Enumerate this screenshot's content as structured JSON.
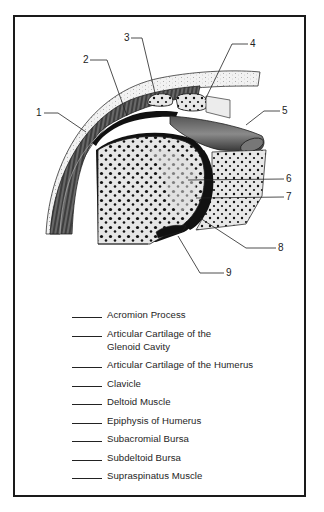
{
  "figure": {
    "callouts": [
      {
        "number": "1"
      },
      {
        "number": "2"
      },
      {
        "number": "3"
      },
      {
        "number": "4"
      },
      {
        "number": "5"
      },
      {
        "number": "6"
      },
      {
        "number": "7"
      },
      {
        "number": "8"
      },
      {
        "number": "9"
      }
    ]
  },
  "legend": {
    "items": [
      {
        "line1": "Acromion Process",
        "line2": ""
      },
      {
        "line1": "Articular Cartilage of the",
        "line2": "Glenoid Cavity"
      },
      {
        "line1": "Articular Cartilage of the Humerus",
        "line2": ""
      },
      {
        "line1": "Clavicle",
        "line2": ""
      },
      {
        "line1": "Deltoid Muscle",
        "line2": ""
      },
      {
        "line1": "Epiphysis of Humerus",
        "line2": ""
      },
      {
        "line1": "Subacromial Bursa",
        "line2": ""
      },
      {
        "line1": "Subdeltoid Bursa",
        "line2": ""
      },
      {
        "line1": "Supraspinatus Muscle",
        "line2": ""
      }
    ]
  },
  "colors": {
    "ink": "#1a1a1a",
    "bone_fill": "#e4e4e4",
    "muscle": "#4a4a4a",
    "paper": "#ffffff"
  }
}
